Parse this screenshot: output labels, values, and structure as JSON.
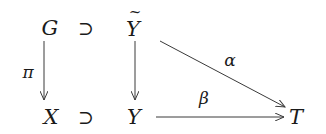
{
  "diagram": {
    "type": "commutative-diagram",
    "nodes": {
      "G": "G",
      "Ytilde": "Y",
      "X": "X",
      "Y": "Y",
      "T": "T"
    },
    "tilde_mark": "~",
    "inclusions": {
      "top": "⊃",
      "bottom": "⊃"
    },
    "arrows": [
      {
        "from": "G",
        "to": "X",
        "label": "π"
      },
      {
        "from": "Ỹ",
        "to": "Y",
        "label": ""
      },
      {
        "from": "Ỹ",
        "to": "T",
        "label": "α"
      },
      {
        "from": "Y",
        "to": "T",
        "label": "β"
      }
    ],
    "colors": {
      "stroke": "#3a3a3a",
      "text": "#1a1a1a",
      "background": "#ffffff"
    }
  }
}
